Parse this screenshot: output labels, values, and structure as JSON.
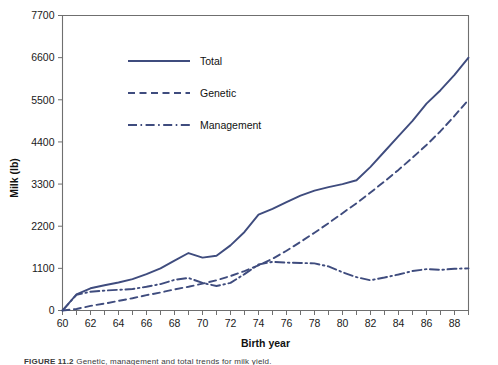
{
  "figure": {
    "caption_prefix": "FIGURE 11.2",
    "caption_rest": "Genetic, management and total trends for milk yield."
  },
  "chart_data": {
    "type": "line",
    "title": "",
    "xlabel": "Birth year",
    "ylabel": "Milk (lb)",
    "xlim": [
      60,
      89
    ],
    "ylim": [
      0,
      7700
    ],
    "grid": false,
    "legend_position": "upper-left-inside",
    "y_ticks": [
      0,
      1100,
      2200,
      3300,
      4400,
      5500,
      6600,
      7700
    ],
    "y_tick_labels": [
      "0",
      "1100",
      "2200",
      "3300",
      "4400",
      "5500",
      "6600",
      "7700"
    ],
    "x_ticks": [
      60,
      61,
      62,
      63,
      64,
      65,
      66,
      67,
      68,
      69,
      70,
      71,
      72,
      73,
      74,
      75,
      76,
      77,
      78,
      79,
      80,
      81,
      82,
      83,
      84,
      85,
      86,
      87,
      88,
      89
    ],
    "x_tick_labels": [
      "60",
      "",
      "62",
      "",
      "64",
      "",
      "66",
      "",
      "68",
      "",
      "70",
      "",
      "72",
      "",
      "74",
      "",
      "76",
      "",
      "78",
      "",
      "80",
      "",
      "82",
      "",
      "84",
      "",
      "86",
      "",
      "88",
      ""
    ],
    "x": [
      60,
      61,
      62,
      63,
      64,
      65,
      66,
      67,
      68,
      69,
      70,
      71,
      72,
      73,
      74,
      75,
      76,
      77,
      78,
      79,
      80,
      81,
      82,
      83,
      84,
      85,
      86,
      87,
      88,
      89
    ],
    "series": [
      {
        "name": "Total",
        "style": "solid",
        "color": "#3f4c7e",
        "values": [
          0,
          420,
          580,
          660,
          730,
          820,
          950,
          1100,
          1300,
          1500,
          1380,
          1430,
          1700,
          2050,
          2500,
          2650,
          2830,
          3000,
          3130,
          3220,
          3300,
          3400,
          3750,
          4150,
          4550,
          4950,
          5400,
          5750,
          6150,
          6600
        ]
      },
      {
        "name": "Genetic",
        "style": "dashed",
        "color": "#3f4c7e",
        "values": [
          0,
          40,
          120,
          180,
          250,
          320,
          400,
          470,
          550,
          620,
          700,
          790,
          900,
          1030,
          1180,
          1350,
          1560,
          1790,
          2030,
          2280,
          2540,
          2800,
          3080,
          3370,
          3670,
          3990,
          4320,
          4680,
          5080,
          5500
        ]
      },
      {
        "name": "Management",
        "style": "dash-dot",
        "color": "#3f4c7e",
        "values": [
          0,
          410,
          490,
          520,
          540,
          560,
          620,
          690,
          800,
          850,
          720,
          640,
          720,
          950,
          1200,
          1270,
          1250,
          1240,
          1230,
          1150,
          1000,
          870,
          790,
          860,
          940,
          1030,
          1080,
          1060,
          1090,
          1100
        ]
      }
    ],
    "legend": [
      {
        "label": "Total",
        "style": "solid"
      },
      {
        "label": "Genetic",
        "style": "dashed"
      },
      {
        "label": "Management",
        "style": "dash-dot"
      }
    ]
  }
}
